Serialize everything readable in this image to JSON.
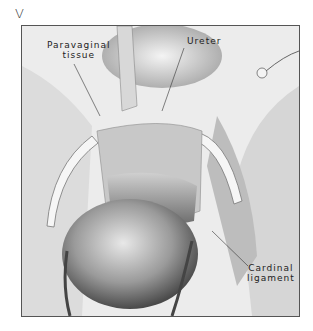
{
  "figure": {
    "panel_letter": "V",
    "labels": {
      "paravaginal_tissue": [
        "Paravaginal",
        "tissue"
      ],
      "ureter": "Ureter",
      "cardinal_ligament": [
        "Cardinal",
        "ligament"
      ]
    },
    "signature": "illegible artist signature",
    "colors": {
      "background": "#ffffff",
      "frame": "#555555",
      "tissue_light": "#e6e6e6",
      "tissue_mid": "#b8b8b8",
      "tissue_dark": "#6e6e6e"
    }
  }
}
